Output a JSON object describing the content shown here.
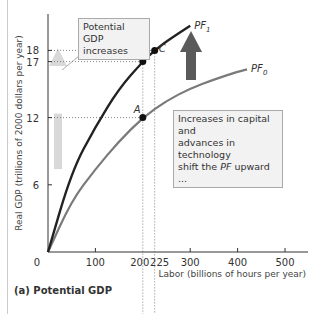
{
  "chart_data": {
    "type": "line",
    "title": "(a) Potential GDP",
    "xlabel": "Labor (billions of hours per year)",
    "ylabel": "Real GDP (trillions of 2000 dollars per year)",
    "x_ticks": [
      0,
      100,
      200,
      225,
      300,
      400,
      500
    ],
    "y_ticks": [
      6,
      12,
      17,
      18
    ],
    "xlim": [
      0,
      550
    ],
    "ylim": [
      0,
      20
    ],
    "series": [
      {
        "name": "PF0",
        "label": "PF",
        "subscript": "0",
        "color": "#7a7a7a",
        "x": [
          0,
          50,
          100,
          150,
          200,
          250,
          300,
          350,
          400,
          420
        ],
        "y": [
          0,
          4.6,
          7.4,
          9.9,
          12,
          13.5,
          14.6,
          15.4,
          16.1,
          16.3
        ]
      },
      {
        "name": "PF1",
        "label": "PF",
        "subscript": "1",
        "color": "#222222",
        "x": [
          0,
          50,
          100,
          150,
          200,
          225,
          250,
          300
        ],
        "y": [
          0,
          7.2,
          11.2,
          14.6,
          17,
          18,
          18.8,
          20.2
        ]
      }
    ],
    "points": [
      {
        "label": "A",
        "x": 200,
        "y": 12,
        "series": "PF0"
      },
      {
        "label": "B",
        "x": 200,
        "y": 17,
        "series": "PF1"
      },
      {
        "label": "C",
        "x": 225,
        "y": 18,
        "series": "PF1"
      }
    ],
    "annotations": [
      {
        "text": "Potential GDP increases",
        "type": "callout"
      },
      {
        "text": "Increases in capital and advances in technology shift the PF upward ...",
        "type": "callout"
      }
    ],
    "arrows": [
      {
        "name": "potential-gdp-arrow",
        "color": "#d9d9d9",
        "from_y": 12,
        "to_y": 18
      },
      {
        "name": "pf-shift-arrow",
        "color": "#5a5a5a"
      }
    ]
  },
  "labels": {
    "origin": "0",
    "callout_gdp_line1": "Potential GDP",
    "callout_gdp_line2": "increases",
    "callout_shift_line1": "Increases in capital and",
    "callout_shift_line2": "advances in technology",
    "callout_shift_line3_pre": "shift the ",
    "callout_shift_line3_pf": "PF",
    "callout_shift_line3_post": " upward ...",
    "panel_title": "(a) Potential GDP"
  }
}
